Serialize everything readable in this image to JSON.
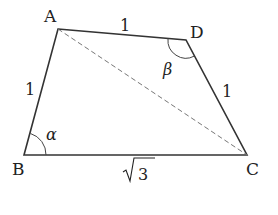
{
  "diagram": {
    "type": "quadrilateral",
    "vertices": {
      "A": {
        "label": "A",
        "x": 58,
        "y": 29
      },
      "B": {
        "label": "B",
        "x": 24,
        "y": 155
      },
      "C": {
        "label": "C",
        "x": 247,
        "y": 155
      },
      "D": {
        "label": "D",
        "x": 186,
        "y": 40
      }
    },
    "sides": {
      "AB": "1",
      "AD": "1",
      "DC": "1",
      "BC_radicand": "3"
    },
    "angles": {
      "alpha": "α",
      "beta": "β"
    },
    "diagonal": "AC (dashed)",
    "colors": {
      "line": "#333333",
      "dashed": "#777777"
    }
  }
}
